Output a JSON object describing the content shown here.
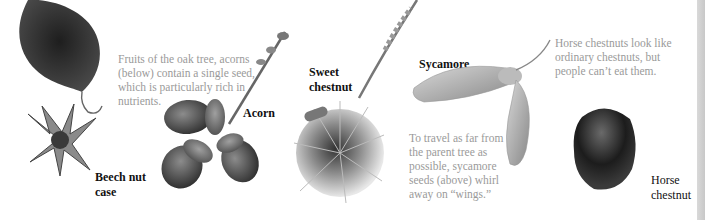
{
  "specimens": [
    {
      "id": "beech",
      "label_line1": "Beech nut",
      "label_line2": "case"
    },
    {
      "id": "acorn",
      "label_line1": "Acorn"
    },
    {
      "id": "sweet_chestnut",
      "label_line1": "Sweet",
      "label_line2": "chestnut"
    },
    {
      "id": "sycamore",
      "label_line1": "Sycamore"
    },
    {
      "id": "horse_chestnut",
      "label_line1": "Horse",
      "label_line2": "chestnut"
    }
  ],
  "captions": {
    "acorn": [
      "Fruits of the oak tree, acorns",
      "(below) contain a single seed,",
      "which is particularly rich in",
      "nutrients."
    ],
    "sycamore": [
      "To travel as far from",
      "the parent tree as",
      "possible, sycamore",
      "seeds (above) whirl",
      "away on “wings.”"
    ],
    "horse_chestnut": [
      "Horse chestnuts look like",
      "ordinary chestnuts, but",
      "people can’t eat them."
    ]
  },
  "colors": {
    "caption_text": "#9a9a9a",
    "label_text": "#111111",
    "edge_strip": "#cfcfcf"
  }
}
